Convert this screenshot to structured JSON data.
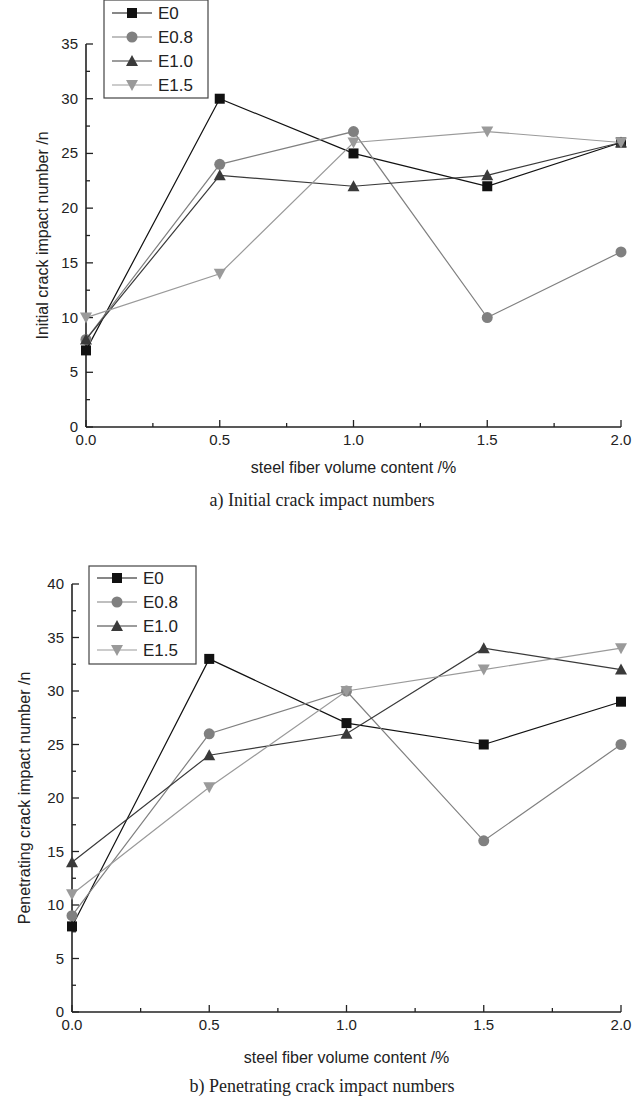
{
  "chart_data": [
    {
      "type": "line",
      "title": "a) Initial crack impact numbers",
      "xlabel": "steel fiber volume content /%",
      "ylabel": "Initial crack impact number /n",
      "x": [
        0.0,
        0.5,
        1.0,
        1.5,
        2.0
      ],
      "xticks": [
        "0.0",
        "0.5",
        "1.0",
        "1.5",
        "2.0"
      ],
      "yticks": [
        "0",
        "5",
        "10",
        "15",
        "20",
        "25",
        "30",
        "35"
      ],
      "xlim": [
        0,
        2.0
      ],
      "ylim": [
        0,
        35
      ],
      "grid": false,
      "legend_position": "top-left",
      "series": [
        {
          "name": "E0",
          "marker": "square",
          "color": "#111111",
          "values": [
            7,
            30,
            25,
            22,
            26
          ]
        },
        {
          "name": "E0.8",
          "marker": "circle",
          "color": "#808080",
          "values": [
            8,
            24,
            27,
            10,
            16
          ]
        },
        {
          "name": "E1.0",
          "marker": "triangle-up",
          "color": "#3a3a3a",
          "values": [
            8,
            23,
            22,
            23,
            26
          ]
        },
        {
          "name": "E1.5",
          "marker": "triangle-down",
          "color": "#9a9a9a",
          "values": [
            10,
            14,
            26,
            27,
            26
          ]
        }
      ]
    },
    {
      "type": "line",
      "title": "b) Penetrating crack impact numbers",
      "xlabel": "steel fiber volume content /%",
      "ylabel": "Penetrating crack impact number /n",
      "x": [
        0.0,
        0.5,
        1.0,
        1.5,
        2.0
      ],
      "xticks": [
        "0.0",
        "0.5",
        "1.0",
        "1.5",
        "2.0"
      ],
      "yticks": [
        "0",
        "5",
        "10",
        "15",
        "20",
        "25",
        "30",
        "35",
        "40"
      ],
      "xlim": [
        0,
        2.0
      ],
      "ylim": [
        0,
        40
      ],
      "grid": false,
      "legend_position": "top-left",
      "series": [
        {
          "name": "E0",
          "marker": "square",
          "color": "#111111",
          "values": [
            8,
            33,
            27,
            25,
            29
          ]
        },
        {
          "name": "E0.8",
          "marker": "circle",
          "color": "#808080",
          "values": [
            9,
            26,
            30,
            16,
            25
          ]
        },
        {
          "name": "E1.0",
          "marker": "triangle-up",
          "color": "#3a3a3a",
          "values": [
            14,
            24,
            26,
            34,
            32
          ]
        },
        {
          "name": "E1.5",
          "marker": "triangle-down",
          "color": "#9a9a9a",
          "values": [
            11,
            21,
            30,
            32,
            34
          ]
        }
      ]
    }
  ]
}
